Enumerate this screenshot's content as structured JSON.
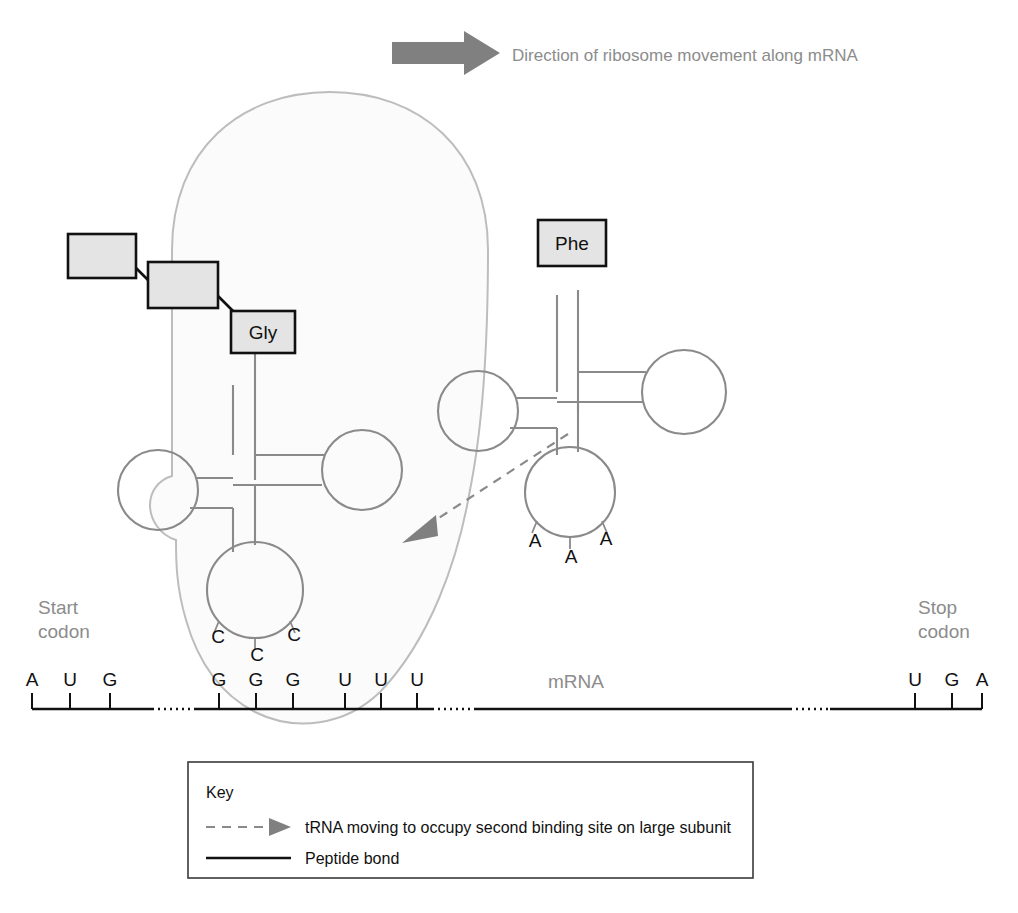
{
  "top_banner": {
    "arrow_name": "direction-arrow",
    "label": "Direction of ribosome movement along mRNA",
    "arrow_color": "#808080",
    "text_color": "#8c8c8c"
  },
  "ribosome": {
    "label": "ribosome",
    "fill": "#fbfbfb",
    "stroke": "#bdbdbd"
  },
  "polypeptide": {
    "boxes": [
      {
        "label": "",
        "name": "amino-acid-box-1"
      },
      {
        "label": "",
        "name": "amino-acid-box-2"
      },
      {
        "label": "Gly",
        "name": "amino-acid-box-gly"
      }
    ],
    "bond_color": "#111111",
    "box_fill": "#e4e4e4"
  },
  "trnas": [
    {
      "name": "trna-gly",
      "amino_acid": "Gly",
      "anticodon": [
        "C",
        "C",
        "C"
      ],
      "position": "first-binding-site"
    },
    {
      "name": "trna-phe",
      "amino_acid": "Phe",
      "anticodon": [
        "A",
        "A",
        "A"
      ],
      "position": "second-binding-site"
    }
  ],
  "mrna": {
    "label": "mRNA",
    "label_color": "#8c8c8c",
    "start_codon_label": "Start\ncodon",
    "start_codon_label_line1": "Start",
    "start_codon_label_line2": "codon",
    "stop_codon_label_line1": "Stop",
    "stop_codon_label_line2": "codon",
    "start_codon": [
      "A",
      "U",
      "G"
    ],
    "codon_1": [
      "G",
      "G",
      "G"
    ],
    "codon_2": [
      "U",
      "U",
      "U"
    ],
    "stop_codon": [
      "U",
      "G",
      "A"
    ],
    "bases_all": [
      "A",
      "U",
      "G",
      "G",
      "G",
      "G",
      "U",
      "U",
      "U",
      "U",
      "G",
      "A"
    ]
  },
  "moving_arrow": {
    "name": "trna-movement-arrow",
    "color": "#8a8a8a",
    "style": "dashed"
  },
  "key": {
    "title": "Key",
    "items": [
      {
        "name": "key-item-trna-moving",
        "glyph": "dashed-arrow-icon",
        "label": "tRNA moving to occupy second binding site on large subunit"
      },
      {
        "name": "key-item-peptide-bond",
        "glyph": "solid-line-icon",
        "label": "Peptide bond"
      }
    ]
  }
}
